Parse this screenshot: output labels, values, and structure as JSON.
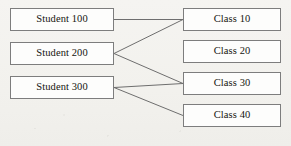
{
  "diagram": {
    "type": "bipartite-relationship-diagram",
    "background_color": "#f3f2ef",
    "node_fill_color": "#fdfdfc",
    "node_border_color": "#7d7d7d",
    "edge_color": "#6e6e6e",
    "text_color": "#15140f",
    "students": [
      {
        "id": "student-100",
        "label": "Student 100",
        "x": 10,
        "y": 8,
        "width": 104,
        "height": 23
      },
      {
        "id": "student-200",
        "label": "Student 200",
        "x": 10,
        "y": 42,
        "width": 104,
        "height": 23
      },
      {
        "id": "student-300",
        "label": "Student 300",
        "x": 10,
        "y": 76,
        "width": 104,
        "height": 23
      }
    ],
    "classes": [
      {
        "id": "class-10",
        "label": "Class 10",
        "x": 183,
        "y": 8,
        "width": 98,
        "height": 23
      },
      {
        "id": "class-20",
        "label": "Class 20",
        "x": 183,
        "y": 40,
        "width": 98,
        "height": 23
      },
      {
        "id": "class-30",
        "label": "Class 30",
        "x": 183,
        "y": 72,
        "width": 98,
        "height": 23
      },
      {
        "id": "class-40",
        "label": "Class 40",
        "x": 183,
        "y": 104,
        "width": 98,
        "height": 23
      }
    ],
    "edges": [
      {
        "id": "edge-student100-class10",
        "from": "student-100",
        "to": "class-10",
        "x1": 114,
        "y1": 19.5,
        "x2": 183,
        "y2": 19.5
      },
      {
        "id": "edge-student200-class10",
        "from": "student-200",
        "to": "class-10",
        "x1": 114,
        "y1": 53.5,
        "x2": 183,
        "y2": 19.5
      },
      {
        "id": "edge-student200-class30",
        "from": "student-200",
        "to": "class-30",
        "x1": 114,
        "y1": 53.5,
        "x2": 183,
        "y2": 83.5
      },
      {
        "id": "edge-student300-class30",
        "from": "student-300",
        "to": "class-30",
        "x1": 114,
        "y1": 87.5,
        "x2": 183,
        "y2": 83.5
      },
      {
        "id": "edge-student300-class40",
        "from": "student-300",
        "to": "class-40",
        "x1": 114,
        "y1": 87.5,
        "x2": 183,
        "y2": 115.5
      }
    ]
  }
}
